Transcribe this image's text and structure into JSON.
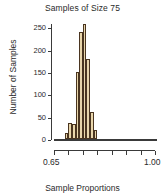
{
  "chart_data": {
    "type": "bar",
    "title": "Samples of Size 75",
    "xlabel": "Sample Proportions",
    "ylabel": "Number of Samples",
    "ylim": [
      0,
      260
    ],
    "xlim": [
      0.65,
      1.0
    ],
    "grid": false,
    "legend": null,
    "ytick_labels": [
      "0",
      "50",
      "100",
      "150",
      "200",
      "250"
    ],
    "ytick_values": [
      0,
      50,
      100,
      150,
      200,
      250
    ],
    "xtick_labels": [
      "0.65",
      "",
      "",
      "",
      "",
      "",
      "",
      "1.00"
    ],
    "xtick_values": [
      0.65,
      0.7,
      0.75,
      0.8,
      0.85,
      0.9,
      0.95,
      1.0
    ],
    "bin_width": 0.0125,
    "bin_starts": [
      0.6875,
      0.7,
      0.7125,
      0.725,
      0.7375,
      0.75,
      0.7625,
      0.775,
      0.7875
    ],
    "categories": [
      "0.688",
      "0.700",
      "0.713",
      "0.725",
      "0.738",
      "0.750",
      "0.763",
      "0.775",
      "0.788"
    ],
    "values": [
      13,
      35,
      33,
      150,
      240,
      257,
      180,
      60,
      20
    ],
    "bar_fill_color": "#E9D6AB",
    "bar_edge_color": "#4A3520",
    "axis_color": "#3A3A3A",
    "background_color": "#FFFFFF"
  },
  "figure": {
    "title": "Samples of Size 75",
    "y_axis_title": "Number of Samples",
    "x_axis_title": "Sample Proportions"
  }
}
